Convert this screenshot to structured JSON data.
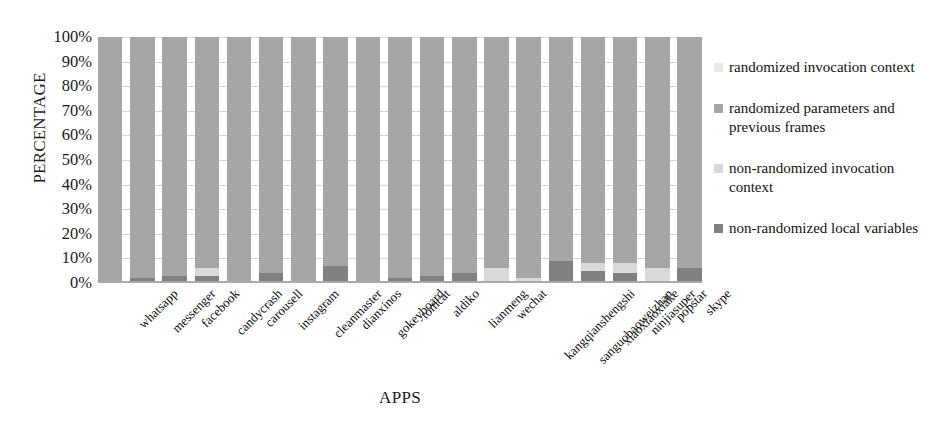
{
  "chart_data": {
    "type": "bar",
    "stacked": true,
    "title": "",
    "xlabel": "APPS",
    "ylabel": "PERCENTAGE",
    "ylim": [
      0,
      100
    ],
    "ytick_labels": [
      "100%",
      "90%",
      "80%",
      "70%",
      "60%",
      "50%",
      "40%",
      "30%",
      "20%",
      "10%",
      "0%"
    ],
    "ytick_values": [
      100,
      90,
      80,
      70,
      60,
      50,
      40,
      30,
      20,
      10,
      0
    ],
    "grid": true,
    "legend_position": "right",
    "categories": [
      "whatsapp",
      "messenger",
      "facebook",
      "candycrash",
      "carousell",
      "instagram",
      "cleanmaster",
      "dianxinos",
      "gokeyboard",
      "tomcat",
      "aldiko",
      "lianmeng",
      "wechat",
      "kangqianshengshi",
      "sanguobaoweizhan",
      "xiaoxiaoxiake",
      "ninjiasuper",
      "popstar",
      "skype"
    ],
    "series": [
      {
        "name": "non-randomized local variables",
        "color": "#808080",
        "values": [
          0,
          2,
          3,
          3,
          1,
          4,
          0,
          7,
          0,
          2,
          3,
          4,
          1,
          1,
          9,
          5,
          4,
          0,
          6
        ]
      },
      {
        "name": "non-randomized invocation context",
        "color": "#d9d9d9",
        "values": [
          0,
          0,
          0,
          3,
          0,
          0,
          0,
          0,
          0,
          0,
          0,
          0,
          5,
          1,
          0,
          3,
          4,
          6,
          0
        ]
      },
      {
        "name": "randomized parameters and previous frames",
        "color": "#a6a6a6",
        "values": [
          100,
          98,
          97,
          94,
          99,
          96,
          100,
          93,
          100,
          98,
          97,
          96,
          94,
          98,
          91,
          92,
          92,
          94,
          94
        ]
      },
      {
        "name": "randomized invocation context",
        "color": "#e8e8e8",
        "values": [
          0,
          0,
          0,
          0,
          0,
          0,
          0,
          0,
          0,
          0,
          0,
          0,
          0,
          0,
          0,
          0,
          0,
          0,
          0
        ]
      }
    ]
  },
  "legend": {
    "items": [
      {
        "label": "randomized invocation context",
        "color": "#e8e8e8"
      },
      {
        "label": "randomized parameters and previous frames",
        "color": "#a6a6a6"
      },
      {
        "label": "non-randomized invocation context",
        "color": "#d9d9d9"
      },
      {
        "label": "non-randomized local variables",
        "color": "#808080"
      }
    ]
  },
  "axes": {
    "y_title": "PERCENTAGE",
    "x_title": "APPS"
  }
}
